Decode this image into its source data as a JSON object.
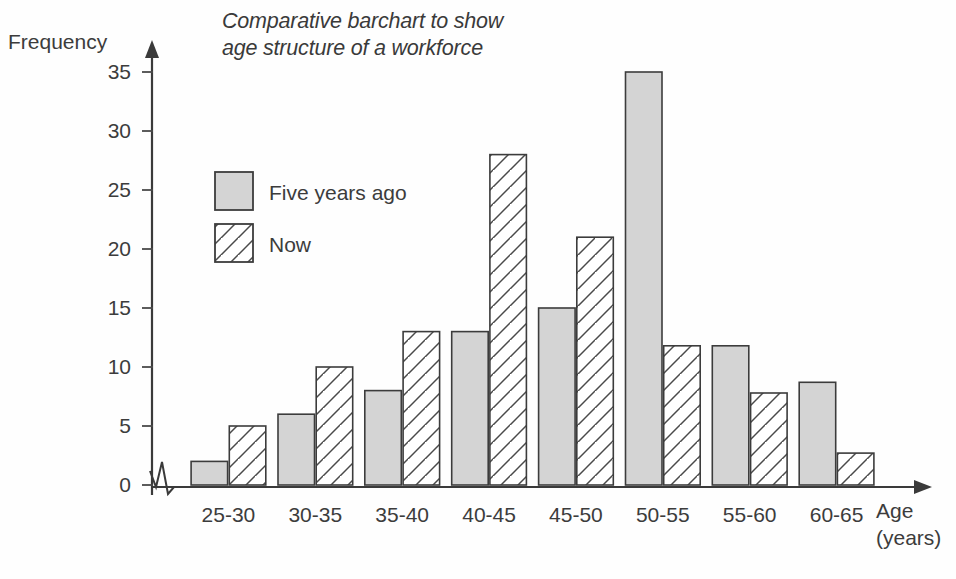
{
  "chart_data": {
    "type": "bar",
    "title": "Comparative barchart to show\nage structure of a workforce",
    "xlabel": "Age\n(years)",
    "ylabel": "Frequency",
    "categories": [
      "25-30",
      "30-35",
      "35-40",
      "40-45",
      "45-50",
      "50-55",
      "55-60",
      "60-65"
    ],
    "series": [
      {
        "name": "Five years ago",
        "values": [
          2,
          6,
          8,
          13,
          15,
          35,
          11.8,
          8.7
        ],
        "fill": "#d4d4d4",
        "pattern": "solid"
      },
      {
        "name": "Now",
        "values": [
          5,
          10,
          13,
          28,
          21,
          11.8,
          7.8,
          2.7
        ],
        "fill": "#ffffff",
        "pattern": "diagonal-hatch"
      }
    ],
    "ylim": [
      0,
      37
    ],
    "yticks": [
      0,
      5,
      10,
      15,
      20,
      25,
      30,
      35
    ],
    "ytick_labels": [
      "0",
      "5",
      "10",
      "15",
      "20",
      "25",
      "30",
      "35"
    ],
    "grid": false,
    "legend_position": "upper-left-inside",
    "axis_break": true
  },
  "legend": {
    "items": [
      {
        "label": "Five years ago",
        "swatch": "solid-gray"
      },
      {
        "label": "Now",
        "swatch": "hatched-white"
      }
    ]
  },
  "colors": {
    "bar_fill_solid": "#d4d4d4",
    "bar_fill_hatch": "#ffffff",
    "stroke": "#3c3c3c",
    "text": "#3c3c3c",
    "background": "#fefefe"
  }
}
